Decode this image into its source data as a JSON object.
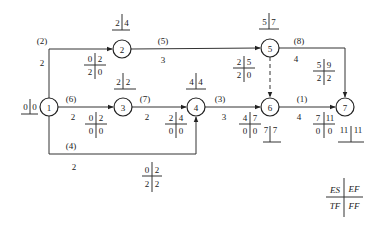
{
  "diagram": {
    "type": "activity-on-arrow network (time parameters)",
    "nodes": [
      {
        "id": "1",
        "label": "1",
        "cx": 49,
        "cy": 107,
        "r": 9
      },
      {
        "id": "2",
        "label": "2",
        "cx": 122,
        "cy": 49,
        "r": 9
      },
      {
        "id": "3",
        "label": "3",
        "cx": 123,
        "cy": 107,
        "r": 9
      },
      {
        "id": "4",
        "label": "4",
        "cx": 196,
        "cy": 107,
        "r": 9
      },
      {
        "id": "5",
        "label": "5",
        "cx": 270,
        "cy": 48,
        "r": 9
      },
      {
        "id": "6",
        "label": "6",
        "cx": 270,
        "cy": 107,
        "r": 9
      },
      {
        "id": "7",
        "label": "7",
        "cx": 345,
        "cy": 107,
        "r": 9
      }
    ],
    "node_times": [
      {
        "node": "1",
        "a": "0",
        "b": "0",
        "x": 34,
        "y": 103
      },
      {
        "node": "2",
        "a": "2",
        "b": "4",
        "x": 122,
        "y": 24
      },
      {
        "node": "3",
        "a": "2",
        "b": "2",
        "x": 123,
        "y": 84
      },
      {
        "node": "4",
        "a": "4",
        "b": "4",
        "x": 196,
        "y": 84
      },
      {
        "node": "5",
        "a": "5",
        "b": "7",
        "x": 270,
        "y": 22
      },
      {
        "node": "6",
        "a": "7",
        "b": "7",
        "x": 270,
        "y": 136
      },
      {
        "node": "7",
        "a": "11",
        "b": "11",
        "x": 351,
        "y": 136
      }
    ],
    "activities": [
      {
        "id": "(2)",
        "from": "1",
        "to": "2",
        "duration": "2",
        "code_pos": [
          42,
          44
        ],
        "dur_pos": [
          42,
          65
        ],
        "ES": "0",
        "EF": "2",
        "TF": "2",
        "FF": "0",
        "box": [
          95,
          65
        ]
      },
      {
        "id": "(5)",
        "from": "2",
        "to": "5",
        "duration": "3",
        "code_pos": [
          163,
          44
        ],
        "dur_pos": [
          163,
          65
        ],
        "ES": "2",
        "EF": "5",
        "TF": "2",
        "FF": "0",
        "box": [
          244,
          68
        ]
      },
      {
        "id": "(6)",
        "from": "1",
        "to": "3",
        "duration": "2",
        "code_pos": [
          71,
          102
        ],
        "dur_pos": [
          73,
          121
        ],
        "ES": "0",
        "EF": "2",
        "TF": "0",
        "FF": "0",
        "box": [
          96,
          120
        ]
      },
      {
        "id": "(7)",
        "from": "3",
        "to": "4",
        "duration": "2",
        "code_pos": [
          144,
          102
        ],
        "dur_pos": [
          147,
          121
        ],
        "ES": "2",
        "EF": "4",
        "TF": "0",
        "FF": "0",
        "box": [
          176,
          120
        ]
      },
      {
        "id": "(4)",
        "from": "1",
        "to": "4",
        "duration": "2",
        "code_pos": [
          71,
          149
        ],
        "dur_pos": [
          73,
          170
        ],
        "ES": "0",
        "EF": "2",
        "TF": "2",
        "FF": "2",
        "box": [
          152,
          176
        ]
      },
      {
        "id": "(3)",
        "from": "4",
        "to": "6",
        "duration": "3",
        "code_pos": [
          219,
          102
        ],
        "dur_pos": [
          224,
          121
        ],
        "ES": "4",
        "EF": "7",
        "TF": "0",
        "FF": "0",
        "box": [
          249,
          124
        ]
      },
      {
        "id": "(8)",
        "from": "5",
        "to": "7",
        "duration": "4",
        "code_pos": [
          299,
          44
        ],
        "dur_pos": [
          296,
          62
        ],
        "ES": "5",
        "EF": "9",
        "TF": "2",
        "FF": "2",
        "box": [
          324,
          71
        ]
      },
      {
        "id": "(1)",
        "from": "6",
        "to": "7",
        "duration": "4",
        "code_pos": [
          301,
          102
        ],
        "dur_pos": [
          299,
          121
        ],
        "ES": "7",
        "EF": "11",
        "TF": "0",
        "FF": "0",
        "box": [
          324,
          124
        ]
      },
      {
        "id": "dummy",
        "from": "5",
        "to": "6",
        "duration": "",
        "dashed": true
      }
    ],
    "legend": {
      "ES": "ES",
      "EF": "EF",
      "TF": "TF",
      "FF": "FF"
    }
  }
}
